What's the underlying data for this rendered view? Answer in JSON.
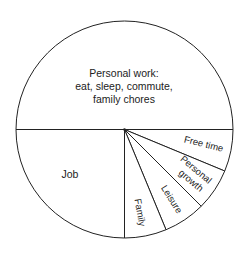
{
  "chart_data": {
    "type": "pie",
    "title": "",
    "start_angle_deg": 0,
    "direction": "clockwise",
    "slices": [
      {
        "label": "Free time",
        "value": 6.25
      },
      {
        "label": "Personal growth",
        "value": 6.25
      },
      {
        "label": "Leisure",
        "value": 6.25
      },
      {
        "label": "Family",
        "value": 6.25
      },
      {
        "label": "Job",
        "value": 25
      },
      {
        "label": "Personal work: eat, sleep, commute, family chores",
        "value": 50
      }
    ],
    "categories": [
      "Free time",
      "Personal growth",
      "Leisure",
      "Family",
      "Job",
      "Personal work: eat, sleep, commute, family chores"
    ],
    "values": [
      6.25,
      6.25,
      6.25,
      6.25,
      25,
      50
    ],
    "colors": {
      "fill": "#ffffff",
      "stroke": "#222222"
    }
  },
  "labels": {
    "personal_work_line1": "Personal work:",
    "personal_work_line2": "eat, sleep, commute,",
    "personal_work_line3": "family chores",
    "job": "Job",
    "family": "Family",
    "leisure": "Leisure",
    "personal_growth_line1": "Personal",
    "personal_growth_line2": "growth",
    "free_time": "Free time"
  }
}
